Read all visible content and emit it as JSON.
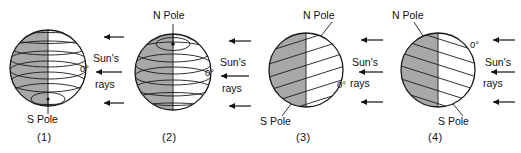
{
  "figure": {
    "colors": {
      "shaded_side": "#a8a8a8",
      "lit_side": "#ffffff",
      "outline": "#1a1a1a",
      "text": "#111111",
      "background": "#ffffff"
    },
    "common_labels": {
      "sun_rays_line1": "Sun's",
      "sun_rays_line2": "rays",
      "equator": "0°",
      "north_pole": "N Pole",
      "south_pole": "S Pole",
      "arrow_icon": "arrow-left-icon",
      "arrow_count": 3
    }
  },
  "globes": [
    {
      "id": "globe-1",
      "caption": "(1)",
      "axis_orientation": "vertical, South Pole tilted toward viewer at bottom",
      "tilt_degrees": 0,
      "lines_type": "latitude-circles",
      "shaded_half": "left",
      "pole_labels": [
        {
          "name": "south-pole-label",
          "text": "S Pole",
          "position": "bottom-center"
        }
      ],
      "equator_label": {
        "text": "0°",
        "position": "right-middle"
      },
      "sun_rays_label": {
        "line1": "Sun's",
        "line2": "rays",
        "position": "right"
      }
    },
    {
      "id": "globe-2",
      "caption": "(2)",
      "axis_orientation": "vertical, North Pole tilted toward viewer at top",
      "tilt_degrees": 0,
      "lines_type": "latitude-circles",
      "shaded_half": "left",
      "pole_labels": [
        {
          "name": "north-pole-label",
          "text": "N Pole",
          "position": "top-center"
        }
      ],
      "equator_label": {
        "text": "0°",
        "position": "right-middle"
      },
      "sun_rays_label": {
        "line1": "Sun's",
        "line2": "rays",
        "position": "right"
      }
    },
    {
      "id": "globe-3",
      "caption": "(3)",
      "axis_orientation": "tilted, North Pole toward upper-right, lines slope up to the right",
      "tilt_degrees": 23,
      "lines_type": "latitude-lines-tilted",
      "shaded_half": "left",
      "pole_labels": [
        {
          "name": "north-pole-label",
          "text": "N Pole",
          "position": "top-right"
        },
        {
          "name": "south-pole-label",
          "text": "S Pole",
          "position": "bottom-left"
        }
      ],
      "equator_label": {
        "text": "0°",
        "position": "right-lower"
      },
      "sun_rays_label": {
        "line1": "Sun's",
        "line2": "rays",
        "position": "right"
      }
    },
    {
      "id": "globe-4",
      "caption": "(4)",
      "axis_orientation": "tilted, North Pole toward upper-left, lines slope down to the right",
      "tilt_degrees": -23,
      "lines_type": "latitude-lines-tilted",
      "shaded_half": "left",
      "pole_labels": [
        {
          "name": "north-pole-label",
          "text": "N Pole",
          "position": "top-left"
        },
        {
          "name": "south-pole-label",
          "text": "S Pole",
          "position": "bottom-right"
        }
      ],
      "equator_label": {
        "text": "0°",
        "position": "right-upper"
      },
      "sun_rays_label": {
        "line1": "Sun's",
        "line2": "rays",
        "position": "right"
      }
    }
  ]
}
